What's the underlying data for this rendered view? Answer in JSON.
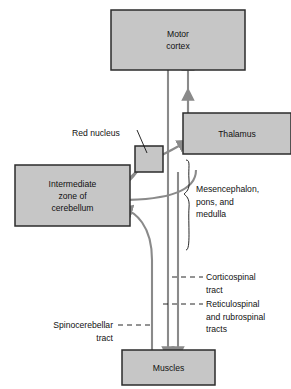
{
  "diagram": {
    "colors": {
      "box_fill": "#c6c6c6",
      "box_stroke": "#2b2b2b",
      "arrow": "#8a8a8a",
      "text": "#111111",
      "background": "#ffffff"
    },
    "boxes": [
      {
        "id": "motor-cortex",
        "lines": [
          "Motor",
          "cortex"
        ],
        "x": 111,
        "y": 10,
        "w": 134,
        "h": 60
      },
      {
        "id": "thalamus",
        "lines": [
          "Thalamus"
        ],
        "x": 183,
        "y": 113,
        "w": 108,
        "h": 41
      },
      {
        "id": "red-nucleus-box",
        "lines": [],
        "x": 135,
        "y": 146,
        "w": 28,
        "h": 26
      },
      {
        "id": "intermediate-zone-cerebellum",
        "lines": [
          "Intermediate",
          "zone of",
          "cerebellum"
        ],
        "x": 15,
        "y": 165,
        "w": 115,
        "h": 61
      },
      {
        "id": "muscles",
        "lines": [
          "Muscles"
        ],
        "x": 122,
        "y": 350,
        "w": 93,
        "h": 35
      }
    ],
    "annotations": [
      {
        "id": "red-nucleus",
        "lines": [
          "Red nucleus"
        ],
        "x": 72,
        "y": 136,
        "align": "start"
      },
      {
        "id": "mesencephalon-pons-medulla",
        "lines": [
          "Mesencephalon,",
          "pons, and",
          "medulla"
        ],
        "x": 196,
        "y": 192,
        "align": "start"
      },
      {
        "id": "corticospinal-tract",
        "lines": [
          "Corticospinal",
          "tract"
        ],
        "x": 206,
        "y": 280,
        "align": "start"
      },
      {
        "id": "reticulospinal-rubrospinal-tracts",
        "lines": [
          "Reticulospinal",
          "and rubrospinal",
          "tracts"
        ],
        "x": 206,
        "y": 307,
        "align": "start"
      },
      {
        "id": "spinocerebellar-tract",
        "lines": [
          "Spinocerebellar",
          "tract"
        ],
        "x": 113,
        "y": 328,
        "align": "end"
      }
    ]
  }
}
